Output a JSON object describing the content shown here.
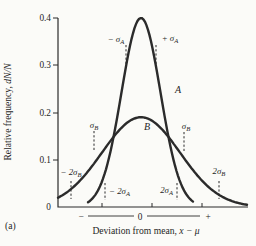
{
  "panel_label": "(a)",
  "chart_data": {
    "type": "line",
    "title": "",
    "xlabel": {
      "text": "Deviation from mean,",
      "var": "x − μ"
    },
    "ylabel": {
      "text": "Relative frequency,",
      "var": "dN/N"
    },
    "ylim": [
      0,
      0.4
    ],
    "ytick_labels": [
      "0.4",
      "0.3",
      "0.2",
      "0.1",
      "0"
    ],
    "x_axis_signs": {
      "minus": "−",
      "zero": "0",
      "plus": "+"
    },
    "grid": false,
    "legend": "inline curve letters",
    "series": [
      {
        "name": "A",
        "shape": "gaussian",
        "mean": 0,
        "sigma": 1,
        "peak": 0.4
      },
      {
        "name": "B",
        "shape": "gaussian",
        "mean": 0,
        "sigma": 2,
        "peak": 0.19
      }
    ],
    "annotations": {
      "minus_sigma_a": {
        "main": "− σ",
        "sub": "A"
      },
      "plus_sigma_a": {
        "main": "+ σ",
        "sub": "A"
      },
      "sigma_b_left": {
        "main": "σ",
        "sub": "B"
      },
      "sigma_b_right": {
        "main": "σ",
        "sub": "B"
      },
      "minus_2sigma_b": {
        "main": "− 2σ",
        "sub": "B"
      },
      "plus_2sigma_b": {
        "main": "2σ",
        "sub": "B"
      },
      "minus_2sigma_a": {
        "main": "− 2σ",
        "sub": "A"
      },
      "plus_2sigma_a": {
        "main": "2σ",
        "sub": "A"
      },
      "curve_a": "A",
      "curve_b": "B"
    }
  }
}
